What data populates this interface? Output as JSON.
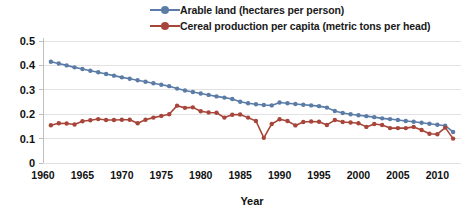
{
  "chart_data": {
    "type": "line",
    "title": "",
    "xlabel": "Year",
    "ylabel": "",
    "xlim": [
      1960,
      2013
    ],
    "ylim": [
      0,
      0.5
    ],
    "grid": true,
    "legend_position": "top-center",
    "y_ticks": [
      "0",
      "0.1",
      "0.2",
      "0.3",
      "0.4",
      "0.5"
    ],
    "y_tick_values": [
      0,
      0.1,
      0.2,
      0.3,
      0.4,
      0.5
    ],
    "x_ticks": [
      "1960",
      "1965",
      "1970",
      "1975",
      "1980",
      "1985",
      "1990",
      "1995",
      "2000",
      "2005",
      "2010"
    ],
    "x_tick_values": [
      1960,
      1965,
      1970,
      1975,
      1980,
      1985,
      1990,
      1995,
      2000,
      2005,
      2010
    ],
    "x": [
      1961,
      1962,
      1963,
      1964,
      1965,
      1966,
      1967,
      1968,
      1969,
      1970,
      1971,
      1972,
      1973,
      1974,
      1975,
      1976,
      1977,
      1978,
      1979,
      1980,
      1981,
      1982,
      1983,
      1984,
      1985,
      1986,
      1987,
      1988,
      1989,
      1990,
      1991,
      1992,
      1993,
      1994,
      1995,
      1996,
      1997,
      1998,
      1999,
      2000,
      2001,
      2002,
      2003,
      2004,
      2005,
      2006,
      2007,
      2008,
      2009,
      2010,
      2011,
      2012
    ],
    "series": [
      {
        "name": "Arable land (hectares per person)",
        "color": "#5b7ca6",
        "marker": "circle",
        "values": [
          0.415,
          0.408,
          0.4,
          0.392,
          0.385,
          0.378,
          0.372,
          0.365,
          0.358,
          0.351,
          0.345,
          0.339,
          0.333,
          0.327,
          0.321,
          0.315,
          0.305,
          0.297,
          0.291,
          0.285,
          0.279,
          0.273,
          0.268,
          0.262,
          0.251,
          0.245,
          0.241,
          0.238,
          0.236,
          0.248,
          0.245,
          0.242,
          0.239,
          0.236,
          0.233,
          0.227,
          0.213,
          0.205,
          0.2,
          0.196,
          0.192,
          0.188,
          0.183,
          0.18,
          0.176,
          0.172,
          0.169,
          0.165,
          0.161,
          0.157,
          0.153,
          0.127
        ]
      },
      {
        "name": "Cereal production per capita (metric tons per head)",
        "color": "#a8453a",
        "marker": "circle",
        "values": [
          0.155,
          0.163,
          0.162,
          0.158,
          0.171,
          0.175,
          0.18,
          0.176,
          0.176,
          0.177,
          0.177,
          0.163,
          0.177,
          0.186,
          0.193,
          0.2,
          0.235,
          0.226,
          0.228,
          0.212,
          0.207,
          0.206,
          0.186,
          0.198,
          0.199,
          0.186,
          0.172,
          0.103,
          0.16,
          0.179,
          0.172,
          0.154,
          0.168,
          0.17,
          0.169,
          0.156,
          0.176,
          0.168,
          0.166,
          0.163,
          0.148,
          0.16,
          0.156,
          0.143,
          0.143,
          0.143,
          0.148,
          0.135,
          0.12,
          0.118,
          0.145,
          0.1
        ]
      }
    ]
  },
  "legend": {
    "entries": [
      {
        "label": "Arable land (hectares per person)"
      },
      {
        "label": "Cereal production per capita (metric tons per head)"
      }
    ]
  }
}
